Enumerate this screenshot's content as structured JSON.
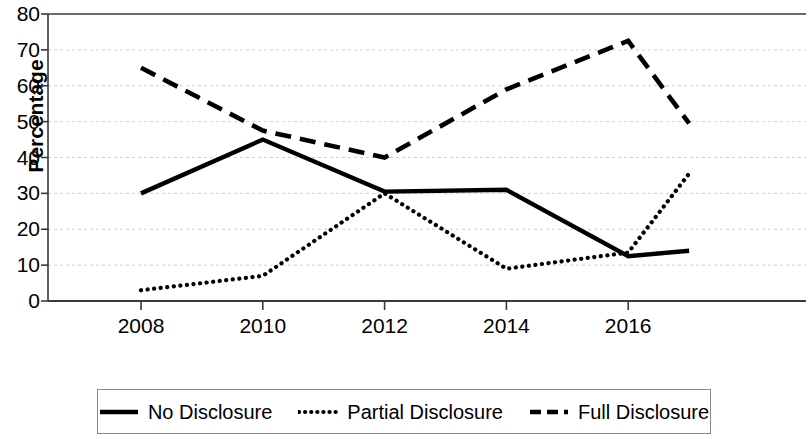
{
  "chart_data": {
    "type": "line",
    "title": "",
    "xlabel": "",
    "ylabel": "Percentage",
    "xlim": [
      2008,
      2017
    ],
    "ylim": [
      0,
      80
    ],
    "ytick_labels": [
      "0",
      "10",
      "20",
      "30",
      "40",
      "50",
      "60",
      "70",
      "80"
    ],
    "ytick_values": [
      0,
      10,
      20,
      30,
      40,
      50,
      60,
      70,
      80
    ],
    "xtick_labels": [
      "2008",
      "2010",
      "2012",
      "2014",
      "2016"
    ],
    "xtick_values": [
      2008,
      2010,
      2012,
      2014,
      2016
    ],
    "x": [
      2008,
      2010,
      2012,
      2014,
      2016,
      2017
    ],
    "grid": true,
    "grid_axis": "y",
    "legend_position": "bottom",
    "series": [
      {
        "name": "No Disclosure",
        "style": "solid",
        "color": "#000000",
        "values": [
          30,
          45,
          30.5,
          31,
          12.5,
          14
        ]
      },
      {
        "name": "Partial Disclosure",
        "style": "dotted",
        "color": "#000000",
        "values": [
          3,
          7,
          30,
          9,
          13.5,
          35.5
        ]
      },
      {
        "name": "Full Disclosure",
        "style": "dashed",
        "color": "#000000",
        "values": [
          65,
          47.5,
          40,
          59,
          72.5,
          49.5
        ]
      }
    ]
  },
  "legend": {
    "entries": [
      {
        "label": "No Disclosure",
        "style": "solid"
      },
      {
        "label": "Partial Disclosure",
        "style": "dotted"
      },
      {
        "label": "Full Disclosure",
        "style": "dashed"
      }
    ]
  },
  "axes": {
    "y_axis_title": "Percentage"
  }
}
